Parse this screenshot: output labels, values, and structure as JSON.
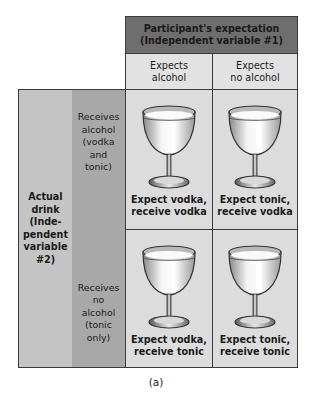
{
  "figure": {
    "header": {
      "title_line1": "Participant's expectation",
      "title_line2": "(Independent variable #1)",
      "columns": [
        {
          "line1": "Expects",
          "line2": "alcohol"
        },
        {
          "line1": "Expects",
          "line2": "no alcohol"
        }
      ]
    },
    "row_variable": {
      "lines": [
        "Actual",
        "drink",
        "(Inde-",
        "pendent",
        "variable",
        "#2)"
      ]
    },
    "rows": [
      {
        "lines": [
          "Receives",
          "alcohol",
          "(vodka",
          "and",
          "tonic)"
        ]
      },
      {
        "lines": [
          "Receives",
          "no",
          "alcohol",
          "(tonic",
          "only)"
        ]
      }
    ],
    "cells": [
      {
        "icon": "wine-glass-icon",
        "line1": "Expect vodka,",
        "line2": "receive vodka"
      },
      {
        "icon": "wine-glass-icon",
        "line1": "Expect tonic,",
        "line2": "receive vodka"
      },
      {
        "icon": "wine-glass-icon",
        "line1": "Expect vodka,",
        "line2": "receive tonic"
      },
      {
        "icon": "wine-glass-icon",
        "line1": "Expect tonic,",
        "line2": "receive tonic"
      }
    ],
    "caption": "(a)",
    "colors": {
      "header_dark": "#6e6e6e",
      "header_light": "#e2e2e2",
      "row_var_bg": "#c4c4c4",
      "row_level_bg": "#a8a8a8",
      "cell_bg": "#dcdcdc",
      "border": "#3a3a3a"
    }
  }
}
